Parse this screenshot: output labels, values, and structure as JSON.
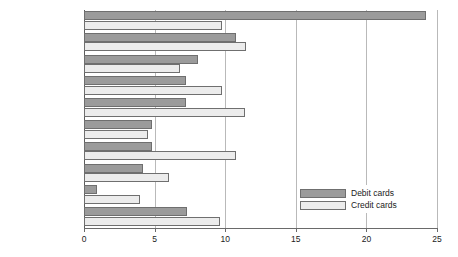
{
  "chart_data": {
    "type": "bar",
    "orientation": "horizontal",
    "title": "",
    "subtitle": "",
    "xlabel": "",
    "ylabel": "",
    "xlim": [
      0,
      25
    ],
    "xticks": [
      0,
      5,
      10,
      15,
      20,
      25
    ],
    "xtick_labels": [
      "0",
      "5",
      "10",
      "15",
      "20",
      "25"
    ],
    "grid": "vertical",
    "legend_position": "inside-right-lower",
    "categories": [
      "Food and drink",
      "Motoring",
      "Mixed business",
      "Household",
      "Services",
      "Clothing",
      "Travel",
      "Entertainment",
      "Hotels",
      "Other"
    ],
    "series": [
      {
        "name": "Debit cards",
        "color": "#9b9b9b",
        "values": [
          24.2,
          10.8,
          8.1,
          7.2,
          7.2,
          4.8,
          4.8,
          4.2,
          0.9,
          7.3
        ]
      },
      {
        "name": "Credit cards",
        "color": "#ececec",
        "values": [
          9.8,
          11.5,
          6.8,
          9.8,
          11.4,
          4.5,
          10.8,
          6.0,
          4.0,
          9.6
        ]
      }
    ]
  },
  "legend": {
    "items": [
      {
        "label": "Debit cards",
        "swatch": "debit"
      },
      {
        "label": "Credit cards",
        "swatch": "credit"
      }
    ]
  },
  "colors": {
    "debit": "#9b9b9b",
    "credit": "#ececec",
    "bar_outline": "#6f6f6f",
    "gridline": "#b9b9b9",
    "axis": "#6a6a6a",
    "text": "#1b1b1b",
    "background": "#ffffff"
  }
}
